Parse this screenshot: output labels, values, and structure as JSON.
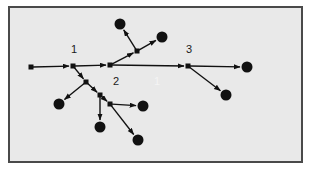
{
  "figure": {
    "background_color": "#e9e9e9",
    "page_color": "#ffffff",
    "frame_color": "#4a4a4a",
    "stroke_color": "#111111",
    "node_fill_color": "#111111",
    "faint_label_color": "#f4f4f4"
  },
  "labels": {
    "node1": "1",
    "node2": "2",
    "node3": "3",
    "faint_one": "1"
  },
  "chart_data": {
    "type": "diagram",
    "title": "",
    "xlabel": "",
    "ylabel": "",
    "xlim": [
      0,
      313
    ],
    "ylim": [
      0,
      170
    ],
    "grid": false,
    "legend": "none",
    "nodes": [
      {
        "id": "root",
        "x": 31,
        "y": 67,
        "kind": "square",
        "size": 5,
        "label": ""
      },
      {
        "id": "n1",
        "x": 73,
        "y": 66,
        "kind": "square",
        "size": 5,
        "label": "1"
      },
      {
        "id": "n2",
        "x": 110,
        "y": 65,
        "kind": "square",
        "size": 5,
        "label": "2"
      },
      {
        "id": "n3",
        "x": 188,
        "y": 66,
        "kind": "square",
        "size": 5,
        "label": "3"
      },
      {
        "id": "u1",
        "x": 137,
        "y": 51,
        "kind": "square",
        "size": 5,
        "label": ""
      },
      {
        "id": "d1",
        "x": 86,
        "y": 82,
        "kind": "square",
        "size": 5,
        "label": ""
      },
      {
        "id": "d2",
        "x": 100,
        "y": 95,
        "kind": "square",
        "size": 5,
        "label": ""
      },
      {
        "id": "d3",
        "x": 110,
        "y": 104,
        "kind": "square",
        "size": 5,
        "label": ""
      },
      {
        "id": "leafA",
        "x": 120,
        "y": 24,
        "kind": "circle",
        "size": 11,
        "label": ""
      },
      {
        "id": "leafB",
        "x": 162,
        "y": 37,
        "kind": "circle",
        "size": 11,
        "label": ""
      },
      {
        "id": "leafC",
        "x": 247,
        "y": 67,
        "kind": "circle",
        "size": 11,
        "label": ""
      },
      {
        "id": "leafD",
        "x": 226,
        "y": 95,
        "kind": "circle",
        "size": 11,
        "label": ""
      },
      {
        "id": "leafE",
        "x": 59,
        "y": 104,
        "kind": "circle",
        "size": 11,
        "label": ""
      },
      {
        "id": "leafF",
        "x": 100,
        "y": 127,
        "kind": "circle",
        "size": 11,
        "label": ""
      },
      {
        "id": "leafG",
        "x": 143,
        "y": 106,
        "kind": "circle",
        "size": 11,
        "label": ""
      },
      {
        "id": "leafH",
        "x": 138,
        "y": 140,
        "kind": "circle",
        "size": 11,
        "label": ""
      }
    ],
    "edges": [
      {
        "from": "root",
        "to": "n1",
        "arrow": true
      },
      {
        "from": "n1",
        "to": "n2",
        "arrow": true
      },
      {
        "from": "n2",
        "to": "n3",
        "arrow": true
      },
      {
        "from": "n3",
        "to": "leafC",
        "arrow": true
      },
      {
        "from": "n3",
        "to": "leafD",
        "arrow": true
      },
      {
        "from": "n2",
        "to": "u1",
        "arrow": true
      },
      {
        "from": "u1",
        "to": "leafA",
        "arrow": true
      },
      {
        "from": "u1",
        "to": "leafB",
        "arrow": true
      },
      {
        "from": "n1",
        "to": "d1",
        "arrow": true
      },
      {
        "from": "d1",
        "to": "leafE",
        "arrow": true
      },
      {
        "from": "d1",
        "to": "d2",
        "arrow": true
      },
      {
        "from": "d2",
        "to": "d3",
        "arrow": true
      },
      {
        "from": "d2",
        "to": "leafF",
        "arrow": true
      },
      {
        "from": "d3",
        "to": "leafG",
        "arrow": true
      },
      {
        "from": "d3",
        "to": "leafH",
        "arrow": true
      }
    ],
    "annotations": [
      {
        "text": "1",
        "x": 71,
        "y": 50,
        "style": "dark"
      },
      {
        "text": "2",
        "x": 113,
        "y": 82,
        "style": "dark"
      },
      {
        "text": "3",
        "x": 186,
        "y": 50,
        "style": "dark"
      },
      {
        "text": "1",
        "x": 155,
        "y": 82,
        "style": "faint"
      }
    ]
  }
}
